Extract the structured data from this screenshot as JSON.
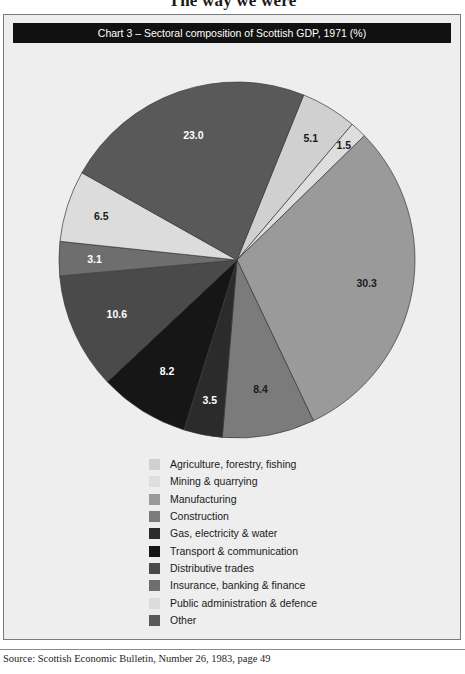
{
  "page": {
    "title": "The way we were",
    "source_note": "Source: Scottish Economic Bulletin, Number 26, 1983, page 49"
  },
  "chart": {
    "header": "Chart 3 – Sectoral composition of Scottish GDP, 1971 (%)"
  },
  "chart_data": {
    "type": "pie",
    "title": "Chart 3 – Sectoral composition of Scottish GDP, 1971 (%)",
    "unit": "%",
    "legend_position": "bottom",
    "start_angle_deg": -68,
    "direction": "clockwise",
    "categories": [
      "Agriculture, forestry, fishing",
      "Mining & quarrying",
      "Manufacturing",
      "Construction",
      "Gas, electricity & water",
      "Transport & communication",
      "Distributive trades",
      "Insurance, banking & finance",
      "Public administration & defence",
      "Other"
    ],
    "values": [
      5.1,
      1.5,
      30.3,
      8.4,
      3.5,
      8.2,
      10.6,
      3.1,
      6.5,
      23.0
    ],
    "value_labels": [
      "5.1",
      "1.5",
      "30.3",
      "8.4",
      "3.5",
      "8.2",
      "10.6",
      "3.1",
      "6.5",
      "23.0"
    ],
    "colors": [
      "#d0d0d0",
      "#dedede",
      "#9a9a9a",
      "#7b7b7b",
      "#2b2b2b",
      "#161616",
      "#4a4a4a",
      "#6e6e6e",
      "#dcdcdc",
      "#595959"
    ],
    "label_text_colors": [
      "#1a1a1a",
      "#1a1a1a",
      "#1a1a1a",
      "#1a1a1a",
      "#ffffff",
      "#ffffff",
      "#ffffff",
      "#ffffff",
      "#1a1a1a",
      "#ffffff"
    ],
    "slices": [
      {
        "label": "Agriculture, forestry, fishing",
        "value": 5.1,
        "value_label": "5.1",
        "color": "#d0d0d0",
        "text_color": "#1a1a1a"
      },
      {
        "label": "Mining & quarrying",
        "value": 1.5,
        "value_label": "1.5",
        "color": "#dedede",
        "text_color": "#1a1a1a"
      },
      {
        "label": "Manufacturing",
        "value": 30.3,
        "value_label": "30.3",
        "color": "#9a9a9a",
        "text_color": "#1a1a1a"
      },
      {
        "label": "Construction",
        "value": 8.4,
        "value_label": "8.4",
        "color": "#7b7b7b",
        "text_color": "#1a1a1a"
      },
      {
        "label": "Gas, electricity & water",
        "value": 3.5,
        "value_label": "3.5",
        "color": "#2b2b2b",
        "text_color": "#ffffff"
      },
      {
        "label": "Transport & communication",
        "value": 8.2,
        "value_label": "8.2",
        "color": "#161616",
        "text_color": "#ffffff"
      },
      {
        "label": "Distributive trades",
        "value": 10.6,
        "value_label": "10.6",
        "color": "#4a4a4a",
        "text_color": "#ffffff"
      },
      {
        "label": "Insurance, banking & finance",
        "value": 3.1,
        "value_label": "3.1",
        "color": "#6e6e6e",
        "text_color": "#ffffff"
      },
      {
        "label": "Public administration & defence",
        "value": 6.5,
        "value_label": "6.5",
        "color": "#dcdcdc",
        "text_color": "#1a1a1a"
      },
      {
        "label": "Other",
        "value": 23.0,
        "value_label": "23.0",
        "color": "#595959",
        "text_color": "#ffffff"
      }
    ]
  },
  "legend": {
    "items": [
      {
        "label": "Agriculture, forestry, fishing",
        "color": "#d0d0d0"
      },
      {
        "label": "Mining & quarrying",
        "color": "#dedede"
      },
      {
        "label": "Manufacturing",
        "color": "#9a9a9a"
      },
      {
        "label": "Construction",
        "color": "#7b7b7b"
      },
      {
        "label": "Gas, electricity & water",
        "color": "#2b2b2b"
      },
      {
        "label": "Transport & communication",
        "color": "#161616"
      },
      {
        "label": "Distributive trades",
        "color": "#4a4a4a"
      },
      {
        "label": "Insurance, banking & finance",
        "color": "#6e6e6e"
      },
      {
        "label": "Public administration & defence",
        "color": "#dcdcdc"
      },
      {
        "label": "Other",
        "color": "#595959"
      }
    ]
  }
}
